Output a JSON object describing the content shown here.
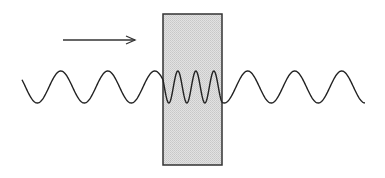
{
  "diagram": {
    "title": "",
    "colors": {
      "background": "#ffffff",
      "slab_fill": "#d9d9d9",
      "slab_border": "#333333",
      "wave_stroke": "#222222",
      "arrow_stroke": "#333333"
    },
    "arrow": {
      "x1": 63,
      "y1": 40,
      "x2": 135,
      "y2": 40,
      "direction": "right"
    },
    "slab": {
      "x": 163,
      "y": 14,
      "width": 59,
      "height": 151
    },
    "wave": {
      "center_y": 87,
      "amplitude": 16,
      "outside_wavelength": 47,
      "inside_wavelength": 18,
      "segments": [
        {
          "name": "incident",
          "x_start": 22,
          "x_end": 163
        },
        {
          "name": "inside-slab",
          "x_start": 163,
          "x_end": 222
        },
        {
          "name": "transmitted",
          "x_start": 222,
          "x_end": 365
        }
      ]
    }
  }
}
